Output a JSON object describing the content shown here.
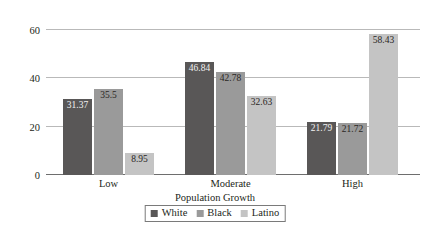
{
  "chart_data": {
    "type": "bar",
    "title": "",
    "subtitle": "",
    "xlabel": "Population Growth",
    "ylabel": "",
    "categories": [
      "Low",
      "Moderate",
      "High"
    ],
    "series": [
      {
        "name": "White",
        "color": "#595757",
        "values": [
          31.37,
          46.84,
          21.79
        ],
        "labels": [
          "31.37",
          "46.84",
          "21.79"
        ]
      },
      {
        "name": "Black",
        "color": "#9a9a9a",
        "values": [
          35.5,
          42.78,
          21.72
        ],
        "labels": [
          "35.5",
          "42.78",
          "21.72"
        ]
      },
      {
        "name": "Latino",
        "color": "#c4c4c4",
        "values": [
          8.95,
          32.63,
          58.43
        ],
        "labels": [
          "8.95",
          "32.63",
          "58.43"
        ]
      }
    ],
    "ylim": [
      0,
      65
    ],
    "yticks": [
      0,
      20,
      40,
      60
    ],
    "ytick_labels": [
      "0",
      "20",
      "40",
      "60"
    ],
    "grid": true,
    "grid_axis": "y",
    "legend_position": "bottom",
    "legend_entries": [
      "White",
      "Black",
      "Latino"
    ],
    "background_color": "#ffffff",
    "gridline_color": "#b9b9b9",
    "axis_color": "#6e6e6e",
    "text_color": "#231f20"
  }
}
